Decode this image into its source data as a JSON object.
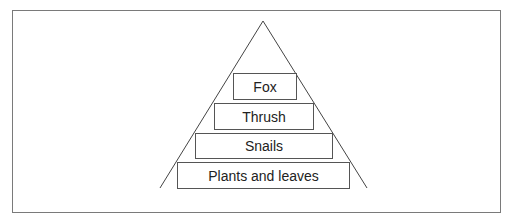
{
  "diagram": {
    "type": "food-pyramid",
    "levels": [
      {
        "label": "Fox"
      },
      {
        "label": "Thrush"
      },
      {
        "label": "Snails"
      },
      {
        "label": "Plants and leaves"
      }
    ]
  }
}
